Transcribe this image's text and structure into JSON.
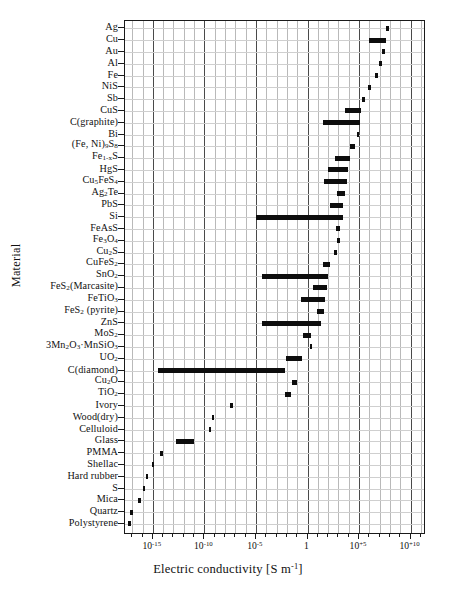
{
  "chart_data": {
    "type": "bar",
    "orientation": "horizontal-range",
    "title": "",
    "xlabel": "Electric conductivity [S m-1]",
    "xlabel_html": "Electric conductivity [S m<sup>-1</sup>]",
    "ylabel": "Material",
    "xscale": "log",
    "xlim": [
      -17.7,
      11.5
    ],
    "grid": true,
    "legend": null,
    "xticks": [
      -15,
      -10,
      -5,
      0,
      5,
      10
    ],
    "xticklabels": [
      "10-15",
      "10-10",
      "10-5",
      "1",
      "10+5",
      "10+10"
    ],
    "xticklabels_html": [
      "10<sup>-15</sup>",
      "10<sup>-10</sup>",
      "10<sup>-5</sup>",
      "1",
      "10<sup>+5</sup>",
      "10<sup>+10</sup>"
    ],
    "categories": [
      "Ag",
      "Cu",
      "Au",
      "Al",
      "Fe",
      "NiS",
      "Sb",
      "CuS",
      "C(graphite)",
      "Bi",
      "(Fe, Ni)9S8",
      "Fe1-xS",
      "HgS",
      "Cu5FeS4",
      "Ag2Te",
      "PbS",
      "Si",
      "FeAsS",
      "Fe3O4",
      "Cu2S",
      "CuFeS2",
      "SnO2",
      "FeS2(Marcasite)",
      "FeTiO3",
      "FeS2 (pyrite)",
      "ZnS",
      "MoS2",
      "3Mn2O3·MnSiO3",
      "UO2",
      "C(diamond)",
      "Cu2O",
      "TiO2",
      "Ivory",
      "Wood(dry)",
      "Celluloid",
      "Glass",
      "PMMA",
      "Shellac",
      "Hard rubber",
      "S",
      "Mica",
      "Quartz",
      "Polystyrene"
    ],
    "categories_html": [
      "Ag",
      "Cu",
      "Au",
      "Al",
      "Fe",
      "NiS",
      "Sb",
      "CuS",
      "C(graphite)",
      "Bi",
      "(Fe, Ni)<sub>9</sub>S<sub>8</sub>",
      "Fe<sub>1-x</sub>S",
      "HgS",
      "Cu<sub>5</sub>FeS<sub>4</sub>",
      "Ag<sub>2</sub>Te",
      "PbS",
      "Si",
      "FeAsS",
      "Fe<sub>3</sub>O<sub>4</sub>",
      "Cu<sub>2</sub>S",
      "CuFeS<sub>2</sub>",
      "SnO<sub>2</sub>",
      "FeS<sub>2</sub>(Marcasite)",
      "FeTiO<sub>3</sub>",
      "FeS<sub>2</sub> (pyrite)",
      "ZnS",
      "MoS<sub>2</sub>",
      "3Mn<sub>2</sub>O<sub>3</sub>&middot;MnSiO<sub>3</sub>",
      "UO<sub>2</sub>",
      "C(diamond)",
      "Cu<sub>2</sub>O",
      "TiO<sub>2</sub>",
      "Ivory",
      "Wood(dry)",
      "Celluloid",
      "Glass",
      "PMMA",
      "Shellac",
      "Hard rubber",
      "S",
      "Mica",
      "Quartz",
      "Polystyrene"
    ],
    "ranges_log10": [
      [
        7.6,
        7.9
      ],
      [
        6.0,
        7.6
      ],
      [
        7.2,
        7.5
      ],
      [
        6.9,
        7.2
      ],
      [
        6.5,
        6.8
      ],
      [
        5.9,
        6.2
      ],
      [
        5.3,
        5.5
      ],
      [
        3.6,
        5.2
      ],
      [
        1.5,
        5.1
      ],
      [
        4.8,
        5.0
      ],
      [
        4.1,
        4.6
      ],
      [
        2.7,
        4.1
      ],
      [
        2.0,
        3.9
      ],
      [
        1.6,
        3.8
      ],
      [
        2.9,
        3.7
      ],
      [
        2.2,
        3.5
      ],
      [
        -5.0,
        3.5
      ],
      [
        2.8,
        3.2
      ],
      [
        2.9,
        3.0
      ],
      [
        2.6,
        2.7
      ],
      [
        1.5,
        2.2
      ],
      [
        -4.4,
        2.0
      ],
      [
        0.5,
        1.9
      ],
      [
        -0.6,
        1.7
      ],
      [
        0.9,
        1.6
      ],
      [
        -4.4,
        1.3
      ],
      [
        -0.4,
        0.4
      ],
      [
        0.2,
        0.4
      ],
      [
        -2.1,
        -0.5
      ],
      [
        -14.5,
        -2.2
      ],
      [
        -1.5,
        -1.0
      ],
      [
        -2.2,
        -1.6
      ],
      [
        -7.5,
        -7.3
      ],
      [
        -9.3,
        -9.1
      ],
      [
        -9.6,
        -9.4
      ],
      [
        -12.8,
        -11.0
      ],
      [
        -14.3,
        -14.1
      ],
      [
        -15.1,
        -14.9
      ],
      [
        -15.7,
        -15.5
      ],
      [
        -16.0,
        -15.8
      ],
      [
        -16.4,
        -16.2
      ],
      [
        -17.2,
        -17.0
      ],
      [
        -17.4,
        -17.2
      ]
    ],
    "colors": {
      "bar": "#0d0d0d",
      "axis": "#1a1a1a",
      "grid": "#b9b9b9"
    }
  }
}
